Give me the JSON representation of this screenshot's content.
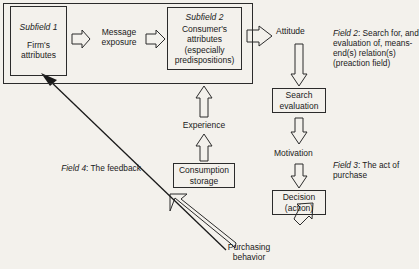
{
  "diagram": {
    "colors": {
      "stroke": "#2b2b2b",
      "background": "#f3f1ec",
      "text": "#1a1a1a"
    },
    "outer_field": {
      "name": "field-1-container"
    },
    "boxes": {
      "subfield1": {
        "header": "Subfield 1",
        "line1": "Firm's",
        "line2": "attributes"
      },
      "subfield2": {
        "header": "Subfield 2",
        "line1": "Consumer's",
        "line2": "attributes",
        "line3": "(especially",
        "line4": "predispositions)"
      },
      "search_evaluation": {
        "line1": "Search",
        "line2": "evaluation"
      },
      "decision": {
        "line1": "Decision",
        "line2": "(action)"
      },
      "consumption_storage": {
        "line1": "Consumption",
        "line2": "storage"
      }
    },
    "labels": {
      "message_exposure": {
        "line1": "Message",
        "line2": "exposure"
      },
      "attitude": "Attitude",
      "motivation": "Motivation",
      "experience": "Experience",
      "purchasing_behavior": {
        "line1": "Purchasing",
        "line2": "behavior"
      }
    },
    "field_annotations": {
      "field2": {
        "name": "Field 2",
        "text": ":  Search for, and evaluation of, means-end(s) relation(s) (preaction field)"
      },
      "field3": {
        "name": "Field 3",
        "text": ":  The act of purchase"
      },
      "field4": {
        "name": "Field 4",
        "text": ":  The feedback"
      }
    },
    "arrows": [
      {
        "name": "arrow-subfield1-to-message",
        "style": "hollow-block",
        "direction": "right"
      },
      {
        "name": "arrow-message-to-subfield2",
        "style": "hollow-block",
        "direction": "right"
      },
      {
        "name": "arrow-subfield2-to-attitude",
        "style": "hollow-block",
        "direction": "right"
      },
      {
        "name": "arrow-attitude-to-search-evaluation",
        "style": "hollow-block",
        "direction": "down"
      },
      {
        "name": "arrow-search-evaluation-to-motivation",
        "style": "hollow-block",
        "direction": "down"
      },
      {
        "name": "arrow-motivation-to-decision",
        "style": "hollow-block",
        "direction": "down"
      },
      {
        "name": "arrow-decision-to-purchasing-behavior",
        "style": "hollow-block",
        "direction": "down-left-diagonal"
      },
      {
        "name": "arrow-purchasing-behavior-feedback",
        "style": "hollow-block",
        "direction": "up-left-diagonal"
      },
      {
        "name": "arrow-consumption-storage-to-experience",
        "style": "hollow-block",
        "direction": "up"
      },
      {
        "name": "arrow-experience-to-subfield2",
        "style": "hollow-block",
        "direction": "up"
      },
      {
        "name": "arrow-feedback-line-to-subfield1",
        "style": "thin-line",
        "direction": "up-left-diagonal"
      }
    ]
  }
}
